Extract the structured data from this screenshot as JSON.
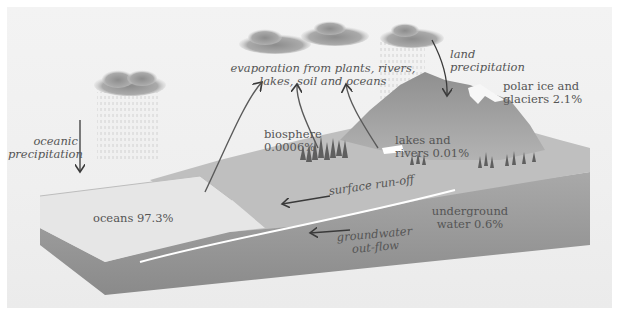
{
  "diagram": {
    "labels": {
      "evaporation": [
        "evaporation from plants, rivers,",
        "lakes, soil and oceans"
      ],
      "land_precipitation": [
        "land",
        "precipitation"
      ],
      "oceanic_precipitation": [
        "oceanic",
        "precipitation"
      ],
      "polar_ice": [
        "polar ice and",
        "glaciers 2.1%"
      ],
      "biosphere": [
        "biosphere",
        "0.0006%"
      ],
      "lakes_rivers": [
        "lakes and",
        "rivers 0.01%"
      ],
      "surface_runoff": "surface run-off",
      "oceans": "oceans 97.3%",
      "underground_water": [
        "underground",
        "water 0.6%"
      ],
      "groundwater_outflow": [
        "groundwater",
        "out-flow"
      ]
    },
    "distribution": [
      {
        "reservoir": "oceans",
        "percent": 97.3
      },
      {
        "reservoir": "polar ice and glaciers",
        "percent": 2.1
      },
      {
        "reservoir": "underground water",
        "percent": 0.6
      },
      {
        "reservoir": "lakes and rivers",
        "percent": 0.01
      },
      {
        "reservoir": "biosphere",
        "percent": 0.0006
      }
    ],
    "colors": {
      "background": "#efefef",
      "land_top": "#bdbdbd",
      "mountain": "#9a9a9a",
      "ocean_top": "#e4e4e4",
      "soil_front": "#8f8f8f",
      "cloud": "#9c9c9c",
      "arrow": "#3a3a3a",
      "text": "#555555"
    }
  }
}
